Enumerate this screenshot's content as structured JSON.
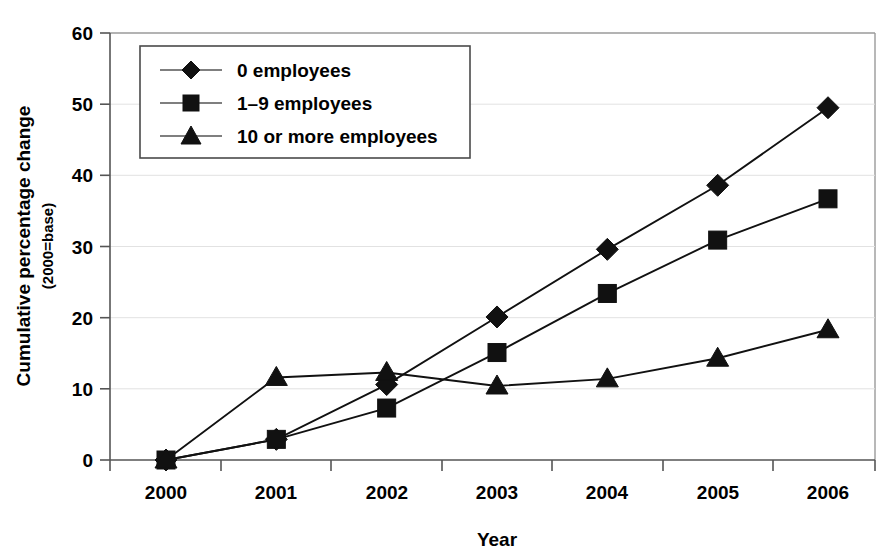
{
  "chart_data": {
    "type": "line",
    "title": "",
    "xlabel": "Year",
    "ylabel": "Cumulative percentage change",
    "ylabel_sub": "(2000=base)",
    "categories": [
      "2000",
      "2001",
      "2002",
      "2003",
      "2004",
      "2005",
      "2006"
    ],
    "x": [
      2000,
      2001,
      2002,
      2003,
      2004,
      2005,
      2006
    ],
    "ylim": [
      0,
      60
    ],
    "xlim": [
      "2000",
      "2006"
    ],
    "ytick_labels": [
      "0",
      "10",
      "20",
      "30",
      "40",
      "50",
      "60"
    ],
    "ytick_values": [
      0,
      10,
      20,
      30,
      40,
      50,
      60
    ],
    "grid": true,
    "grid_axis": "y",
    "legend_position": "top-left-inside",
    "series": [
      {
        "name": "0 employees",
        "marker": "diamond",
        "color": "#111111",
        "values": [
          0.0,
          2.9,
          10.6,
          20.1,
          29.6,
          38.6,
          49.5
        ]
      },
      {
        "name": "1–9 employees",
        "marker": "square",
        "color": "#111111",
        "values": [
          0.0,
          2.9,
          7.3,
          15.1,
          23.4,
          30.9,
          36.7
        ]
      },
      {
        "name": "10 or more employees",
        "marker": "triangle",
        "color": "#111111",
        "values": [
          0.0,
          11.6,
          12.3,
          10.4,
          11.4,
          14.3,
          18.3
        ]
      }
    ]
  },
  "legend": {
    "items": [
      {
        "label": "0 employees",
        "marker": "diamond-marker-icon"
      },
      {
        "label": "1–9 employees",
        "marker": "square-marker-icon"
      },
      {
        "label": "10 or more employees",
        "marker": "triangle-marker-icon"
      }
    ]
  },
  "axes": {
    "y_title_line1": "Cumulative percentage change",
    "y_title_line2": "(2000=base)",
    "x_title": "Year"
  }
}
